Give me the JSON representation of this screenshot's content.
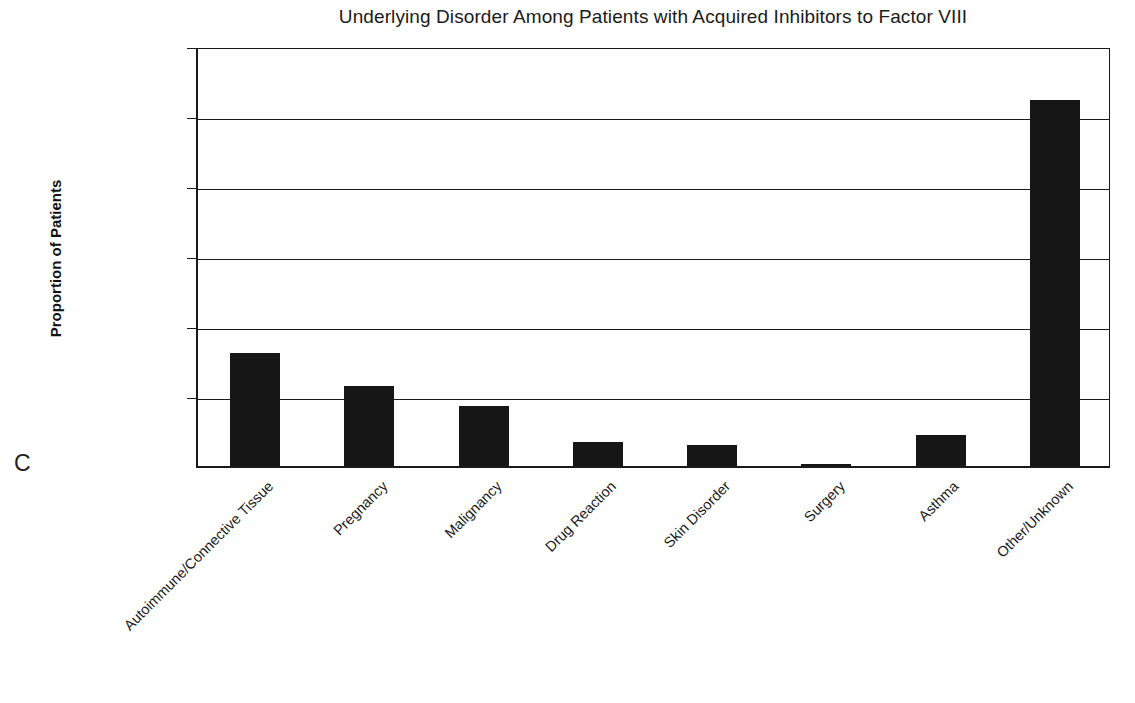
{
  "panel": {
    "label": "C"
  },
  "chart_data": {
    "type": "bar",
    "title": "Underlying Disorder Among Patients with Acquired Inhibitors to Factor VIII",
    "xlabel": "",
    "ylabel": "Proportion of Patients",
    "categories": [
      "Autoimmune/Connective Tissue",
      "Pregnancy",
      "Malignancy",
      "Drug Reaction",
      "Skin Disorder",
      "Surgery",
      "Asthma",
      "Other/Unknown"
    ],
    "values": [
      0.161,
      0.114,
      0.086,
      0.034,
      0.03,
      0.003,
      0.044,
      0.523
    ],
    "ylim": [
      0.0,
      0.6
    ],
    "ytick_values": [
      0.0,
      0.1,
      0.2,
      0.3,
      0.4,
      0.5,
      0.6
    ],
    "ytick_labels": [
      "0.00",
      "0.10",
      "0.20",
      "0.30",
      "0.40",
      "0.50",
      "0.60"
    ],
    "grid": true,
    "legend": "none",
    "bar_color": "#161616",
    "axis_color": "#1a1a1a",
    "background_color": "#ffffff"
  }
}
